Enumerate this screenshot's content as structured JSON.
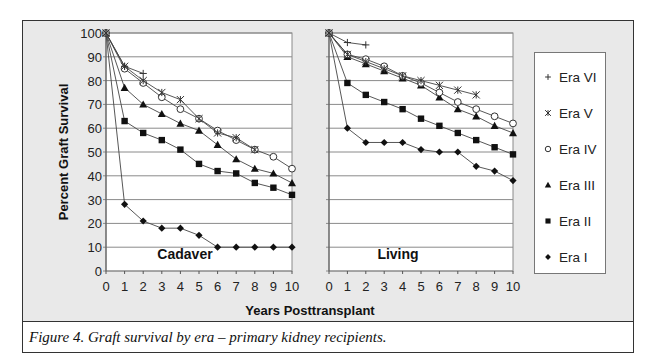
{
  "caption": "Figure 4.  Graft survival by era – primary kidney recipients.",
  "chart_data": [
    {
      "type": "line",
      "panel": "Cadaver",
      "xlabel": "Years Posttransplant",
      "ylabel": "Percent Graft Survival",
      "x": [
        0,
        1,
        2,
        3,
        4,
        5,
        6,
        7,
        8,
        9,
        10
      ],
      "xlim": [
        0,
        10
      ],
      "ylim": [
        0,
        100
      ],
      "yticks": [
        0,
        10,
        20,
        30,
        40,
        50,
        60,
        70,
        80,
        90,
        100
      ],
      "grid": "horizontal",
      "series": [
        {
          "name": "Era VI",
          "marker": "plus",
          "values": [
            100,
            86,
            83
          ]
        },
        {
          "name": "Era V",
          "marker": "asterisk",
          "values": [
            100,
            86,
            80,
            75,
            72,
            64,
            58,
            56,
            51
          ]
        },
        {
          "name": "Era IV",
          "marker": "open-circle",
          "values": [
            100,
            85,
            79,
            73,
            68,
            64,
            59,
            55,
            51,
            48,
            43
          ]
        },
        {
          "name": "Era III",
          "marker": "triangle",
          "values": [
            100,
            77,
            70,
            66,
            62,
            59,
            53,
            47,
            43,
            41,
            37
          ]
        },
        {
          "name": "Era II",
          "marker": "square",
          "values": [
            100,
            63,
            58,
            55,
            51,
            45,
            42,
            41,
            37,
            35,
            32
          ]
        },
        {
          "name": "Era I",
          "marker": "diamond",
          "values": [
            100,
            28,
            21,
            18,
            18,
            15,
            10,
            10,
            10,
            10,
            10
          ]
        }
      ]
    },
    {
      "type": "line",
      "panel": "Living",
      "xlabel": "Years Posttransplant",
      "ylabel": "Percent Graft Survival",
      "x": [
        0,
        1,
        2,
        3,
        4,
        5,
        6,
        7,
        8,
        9,
        10
      ],
      "xlim": [
        0,
        10
      ],
      "ylim": [
        0,
        100
      ],
      "grid": "horizontal",
      "series": [
        {
          "name": "Era VI",
          "marker": "plus",
          "values": [
            100,
            96,
            95
          ]
        },
        {
          "name": "Era V",
          "marker": "asterisk",
          "values": [
            100,
            91,
            88,
            85,
            82,
            80,
            78,
            76,
            74
          ]
        },
        {
          "name": "Era IV",
          "marker": "open-circle",
          "values": [
            100,
            91,
            89,
            86,
            82,
            79,
            75,
            71,
            68,
            65,
            62
          ]
        },
        {
          "name": "Era III",
          "marker": "triangle",
          "values": [
            100,
            90,
            87,
            84,
            81,
            78,
            73,
            68,
            65,
            61,
            58
          ]
        },
        {
          "name": "Era II",
          "marker": "square",
          "values": [
            100,
            79,
            74,
            71,
            68,
            64,
            61,
            58,
            55,
            52,
            49
          ]
        },
        {
          "name": "Era I",
          "marker": "diamond",
          "values": [
            100,
            60,
            54,
            54,
            54,
            51,
            50,
            50,
            44,
            42,
            38
          ]
        }
      ]
    }
  ],
  "legend": {
    "placement": "right",
    "items": [
      {
        "label": "Era VI",
        "marker": "plus"
      },
      {
        "label": "Era V",
        "marker": "asterisk"
      },
      {
        "label": "Era IV",
        "marker": "open-circle"
      },
      {
        "label": "Era III",
        "marker": "triangle"
      },
      {
        "label": "Era II",
        "marker": "square"
      },
      {
        "label": "Era I",
        "marker": "diamond"
      }
    ]
  },
  "colors": {
    "line": "#444444",
    "marker": "#111111",
    "grid": "#8a8a8a",
    "plot_bg": "#ffffff",
    "frame_bg": "#e9e9e9"
  }
}
